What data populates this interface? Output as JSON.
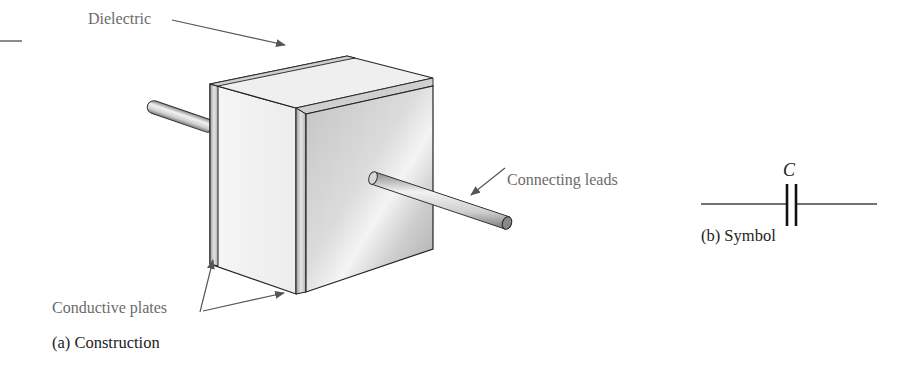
{
  "figure": {
    "panel_a": {
      "caption": "(a) Construction",
      "callouts": {
        "dielectric": "Dielectric",
        "connecting_leads": "Connecting leads",
        "conductive_plates": "Conductive plates"
      }
    },
    "panel_b": {
      "caption": "(b) Symbol",
      "component_label": "C"
    }
  },
  "colors": {
    "callout_text": "#6b6b6b",
    "caption_text": "#222222",
    "arrow": "#555555",
    "outline": "#222222"
  }
}
